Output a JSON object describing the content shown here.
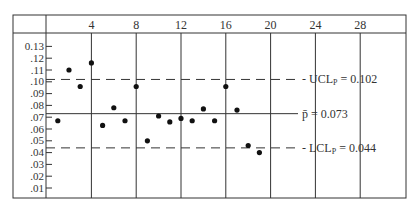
{
  "chart_data": {
    "type": "scatter",
    "title": "",
    "xlabel": "Sample number",
    "ylabel": "Proportion defective",
    "x_ticks": [
      4,
      8,
      12,
      16,
      20,
      24,
      28
    ],
    "y_ticks": [
      ".01",
      ".02",
      ".03",
      ".04",
      ".05",
      ".06",
      ".07",
      ".08",
      ".09",
      ".10",
      ".11",
      ".12",
      "0.13"
    ],
    "xlim": [
      0,
      30
    ],
    "ylim": [
      0,
      0.135
    ],
    "grid": "vertical lines at x ticks",
    "x": [
      1,
      2,
      3,
      4,
      5,
      6,
      7,
      8,
      9,
      10,
      11,
      12,
      13,
      14,
      15,
      16,
      17,
      18,
      19
    ],
    "values": [
      0.067,
      0.11,
      0.096,
      0.116,
      0.063,
      0.078,
      0.067,
      0.096,
      0.05,
      0.071,
      0.066,
      0.069,
      0.067,
      0.077,
      0.067,
      0.096,
      0.076,
      0.046,
      0.04
    ],
    "reference_lines": [
      {
        "name": "UCL",
        "label_main": "UCL",
        "label_sub": "P",
        "label_value": " = 0.102",
        "value": 0.102,
        "style": "dashed"
      },
      {
        "name": "center",
        "label_main": "p̄",
        "label_sub": "",
        "label_value": " = 0.073",
        "value": 0.073,
        "style": "solid"
      },
      {
        "name": "LCL",
        "label_main": "LCL",
        "label_sub": "P",
        "label_value": " = 0.044",
        "value": 0.044,
        "style": "dashed"
      }
    ]
  }
}
